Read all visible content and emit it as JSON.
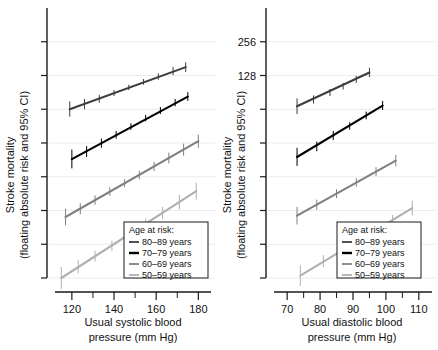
{
  "figure": {
    "type": "multi-panel-line-chart",
    "panels": 2,
    "background": "#ffffff",
    "series_colors": {
      "80-89": "#3d3d3d",
      "70-79": "#000000",
      "60-69": "#808080",
      "50-59": "#b0b0b0"
    },
    "gridline_color": "#ebebeb",
    "axis_color": "#1a1a1a"
  },
  "legend": {
    "title": "Age at risk:",
    "entries": [
      {
        "label": "80–89 years",
        "color": "#3d3d3d"
      },
      {
        "label": "70–79 years",
        "color": "#000000"
      },
      {
        "label": "60–69 years",
        "color": "#808080"
      },
      {
        "label": "50–59 years",
        "color": "#b0b0b0"
      }
    ]
  },
  "chart_data": [
    {
      "type": "line",
      "panel": "left",
      "title": "",
      "xlabel": "Usual systolic blood pressure (mm Hg)",
      "xlabel_line1": "Usual systolic blood",
      "xlabel_line2": "pressure (mm Hg)",
      "ylabel": "Stroke mortality (floating absolute risk and 95% CI)",
      "ylabel_line1": "Stroke mortality",
      "ylabel_line2": "(floating absolute risk and 95% CI)",
      "yscale": "log2",
      "xlim": [
        112,
        186
      ],
      "xticks": [
        120,
        140,
        160,
        180
      ],
      "xtick_labels": [
        "120",
        "140",
        "160",
        "180"
      ],
      "xminor_ticks": [
        130,
        150,
        170
      ],
      "ylim_log2": [
        1.0,
        9.0
      ],
      "yticks_log2": [
        1,
        2,
        3,
        4,
        5,
        6,
        7,
        8
      ],
      "ytick_labels": [
        "",
        "",
        "",
        "",
        "",
        "",
        "",
        ""
      ],
      "grid": true,
      "series": [
        {
          "name": "80–89 years",
          "color": "#3d3d3d",
          "x": [
            119,
            126,
            133,
            140,
            147,
            154,
            161,
            168,
            174
          ],
          "y": [
            64,
            71,
            79,
            89,
            100,
            112,
            125,
            140,
            152
          ],
          "ci_low": [
            55,
            64,
            73,
            84,
            95,
            106,
            117,
            129,
            138
          ],
          "ci_high": [
            75,
            79,
            86,
            95,
            106,
            119,
            134,
            152,
            168
          ]
        },
        {
          "name": "70–79 years",
          "color": "#000000",
          "x": [
            120,
            127,
            134,
            141,
            148,
            155,
            162,
            169,
            175
          ],
          "y": [
            23,
            27,
            32,
            38,
            45,
            53,
            62,
            73,
            83
          ],
          "ci_low": [
            19,
            24,
            29,
            35,
            42,
            50,
            58,
            68,
            76
          ],
          "ci_high": [
            28,
            30,
            35,
            41,
            48,
            57,
            67,
            79,
            91
          ]
        },
        {
          "name": "60–69 years",
          "color": "#808080",
          "x": [
            117,
            124,
            131,
            138,
            145,
            152,
            159,
            166,
            173,
            180
          ],
          "y": [
            7.0,
            8.3,
            9.9,
            11.8,
            14.0,
            16.6,
            19.8,
            23.5,
            27.9,
            33.2
          ],
          "ci_low": [
            5.9,
            7.4,
            9.0,
            10.8,
            12.9,
            15.2,
            18.0,
            21.0,
            24.6,
            29.0
          ],
          "ci_high": [
            8.3,
            9.3,
            10.9,
            12.9,
            15.2,
            18.1,
            21.8,
            26.3,
            31.6,
            38.0
          ]
        },
        {
          "name": "50–59 years",
          "color": "#b0b0b0",
          "x": [
            115,
            123,
            131,
            139,
            147,
            155,
            163,
            171,
            179
          ],
          "y": [
            2.0,
            2.5,
            3.1,
            3.9,
            4.9,
            6.1,
            7.6,
            9.5,
            11.9
          ],
          "ci_low": [
            1.6,
            2.2,
            2.8,
            3.5,
            4.4,
            5.5,
            6.7,
            8.2,
            10.0
          ],
          "ci_high": [
            2.5,
            2.9,
            3.5,
            4.3,
            5.4,
            6.8,
            8.6,
            11.0,
            14.2
          ]
        }
      ]
    },
    {
      "type": "line",
      "panel": "right",
      "title": "",
      "xlabel": "Usual diastolic blood pressure (mm Hg)",
      "xlabel_line1": "Usual diastolic blood",
      "xlabel_line2": "pressure (mm Hg)",
      "ylabel": "Stroke mortality (floating absolute risk and 95% CI)",
      "ylabel_line1": "Stroke mortality",
      "ylabel_line2": "(floating absolute risk and 95% CI)",
      "yscale": "log2",
      "xlim": [
        66,
        114
      ],
      "xticks": [
        70,
        80,
        90,
        100,
        110
      ],
      "xtick_labels": [
        "70",
        "80",
        "90",
        "100",
        "110"
      ],
      "xminor_ticks": [
        75,
        85,
        95,
        105
      ],
      "ylim_log2": [
        1.0,
        9.0
      ],
      "yticks_log2": [
        1,
        2,
        3,
        4,
        5,
        6,
        7,
        8
      ],
      "ytick_labels": [
        "",
        "",
        "",
        "",
        "",
        "",
        "128",
        "256"
      ],
      "ytick_values": [
        256,
        128
      ],
      "grid": true,
      "series": [
        {
          "name": "80–89 years",
          "color": "#3d3d3d",
          "x": [
            73,
            78,
            83,
            87,
            91,
            95
          ],
          "y": [
            68,
            78,
            90,
            103,
            118,
            136
          ],
          "ci_low": [
            58,
            72,
            84,
            96,
            110,
            124
          ],
          "ci_high": [
            80,
            85,
            97,
            110,
            127,
            150
          ]
        },
        {
          "name": "70–79 years",
          "color": "#000000",
          "x": [
            73,
            79,
            84,
            89,
            94,
            99
          ],
          "y": [
            24,
            30,
            37,
            45,
            56,
            69
          ],
          "ci_low": [
            20,
            27,
            34,
            42,
            52,
            63
          ],
          "ci_high": [
            29,
            33,
            41,
            49,
            61,
            76
          ]
        },
        {
          "name": "60–69 years",
          "color": "#808080",
          "x": [
            73,
            79,
            85,
            91,
            97,
            103
          ],
          "y": [
            7.2,
            9.0,
            11.3,
            14.2,
            17.8,
            22.3
          ],
          "ci_low": [
            6.0,
            8.1,
            10.3,
            13.0,
            16.2,
            19.8
          ],
          "ci_high": [
            8.6,
            10.0,
            12.4,
            15.5,
            19.5,
            25.1
          ]
        },
        {
          "name": "50–59 years",
          "color": "#b0b0b0",
          "x": [
            74,
            81,
            88,
            95,
            102,
            108
          ],
          "y": [
            2.1,
            2.8,
            3.7,
            4.9,
            6.5,
            8.4
          ],
          "ci_low": [
            1.7,
            2.5,
            3.3,
            4.4,
            5.8,
            7.2
          ],
          "ci_high": [
            2.6,
            3.2,
            4.2,
            5.5,
            7.3,
            9.8
          ]
        }
      ]
    }
  ]
}
